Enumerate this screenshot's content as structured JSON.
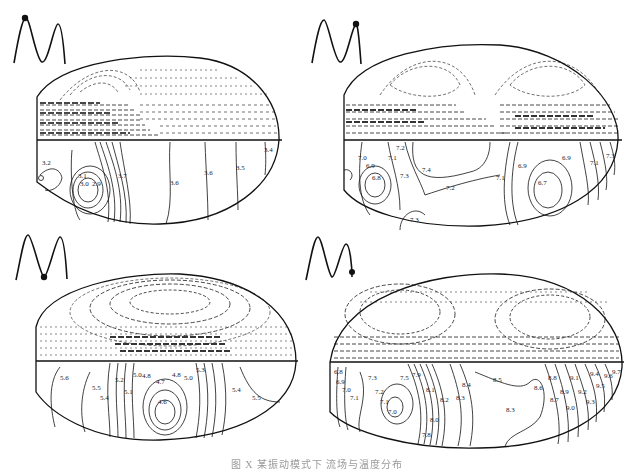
{
  "figure": {
    "caption": "图 X  某振动模式下 流场与温度分布"
  },
  "panels": [
    {
      "id": "top-left",
      "phase_marker": "first peak",
      "contour_labels": [
        "3.2",
        "3.3",
        "3.4",
        "3.5",
        "3.6",
        "3.7",
        "3.1",
        "3.0",
        "2.9",
        "3.7",
        "3.6",
        "3.5",
        "3.4"
      ]
    },
    {
      "id": "top-right",
      "phase_marker": "second peak",
      "contour_labels": [
        "7.0",
        "7.1",
        "7.2",
        "6.9",
        "6.8",
        "7.3",
        "7.4",
        "7.2",
        "7.3",
        "7.1",
        "7.0",
        "6.9",
        "6.8",
        "6.7",
        "6.9",
        "7.0",
        "7.1",
        "7.2",
        "7.3"
      ]
    },
    {
      "id": "bottom-left",
      "phase_marker": "trough",
      "contour_labels": [
        "5.6",
        "5.5",
        "5.4",
        "5.3",
        "5.2",
        "5.1",
        "5.0",
        "4.9",
        "4.8",
        "4.7",
        "4.6",
        "4.8",
        "4.9",
        "5.0",
        "5.1",
        "5.2",
        "5.3",
        "5.4",
        "5.5"
      ]
    },
    {
      "id": "bottom-right",
      "phase_marker": "end of cycle",
      "contour_labels": [
        "6.8",
        "6.9",
        "7.0",
        "7.1",
        "7.2",
        "7.3",
        "7.5",
        "7.9",
        "7.2",
        "7.1",
        "7.0",
        "8.1",
        "8.2",
        "8.3",
        "8.4",
        "8.5",
        "8.6",
        "8.7",
        "8.8",
        "8.9",
        "9.0",
        "9.1",
        "9.2",
        "9.3",
        "9.4",
        "9.5",
        "9.6",
        "9.7",
        "8.0",
        "7.8",
        "8.3"
      ]
    }
  ]
}
